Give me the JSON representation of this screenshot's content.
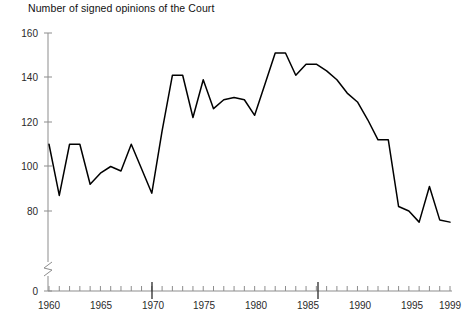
{
  "chart_data": {
    "type": "line",
    "title": "Number of signed opinions of the Court",
    "xlabel": "",
    "ylabel": "",
    "grid": false,
    "legend": null,
    "xlim": [
      1960,
      1999
    ],
    "ylim": [
      0,
      160
    ],
    "y_axis_break": true,
    "y_axis_break_between": [
      0,
      80
    ],
    "y_ticks": [
      0,
      80,
      100,
      120,
      140,
      160
    ],
    "y_tick_labels": [
      "0",
      "80",
      "100",
      "120",
      "140",
      "160"
    ],
    "x_ticks_major": [
      1960,
      1965,
      1970,
      1975,
      1980,
      1985,
      1990,
      1995,
      1999
    ],
    "x_tick_labels": [
      "1960",
      "1965",
      "1970",
      "1975",
      "1980",
      "1985",
      "1990",
      "1995",
      "1999"
    ],
    "x_ticks_emphasized": [
      1970,
      1986
    ],
    "x_minor_tick_interval": 1,
    "x": [
      1960,
      1961,
      1962,
      1963,
      1964,
      1965,
      1966,
      1967,
      1968,
      1969,
      1970,
      1971,
      1972,
      1973,
      1974,
      1975,
      1976,
      1977,
      1978,
      1979,
      1980,
      1981,
      1982,
      1983,
      1984,
      1985,
      1986,
      1987,
      1988,
      1989,
      1990,
      1991,
      1992,
      1993,
      1994,
      1995,
      1996,
      1997,
      1998,
      1999
    ],
    "values": [
      110,
      87,
      110,
      110,
      92,
      97,
      100,
      98,
      110,
      99,
      88,
      116,
      141,
      141,
      122,
      139,
      126,
      130,
      131,
      130,
      123,
      137,
      151,
      151,
      141,
      146,
      146,
      143,
      139,
      133,
      129,
      121,
      112,
      112,
      82,
      80,
      75,
      91,
      76,
      75
    ],
    "series_name": "Signed opinions",
    "line_color": "#000000"
  }
}
